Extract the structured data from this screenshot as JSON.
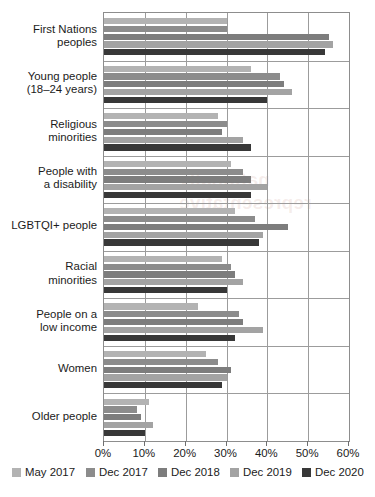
{
  "watermark": {
    "text": "nationally representative"
  },
  "chart_data": {
    "type": "bar",
    "orientation": "horizontal",
    "title": "",
    "subtitle": "",
    "xlabel": "",
    "ylabel": "",
    "xlim": [
      0,
      60
    ],
    "grid": true,
    "legend_position": "bottom",
    "xticks": [
      0,
      10,
      20,
      30,
      40,
      50,
      60
    ],
    "xtick_labels": [
      "0%",
      "10%",
      "20%",
      "30%",
      "40%",
      "50%",
      "60%"
    ],
    "categories": [
      "First Nations peoples",
      "Young people (18–24 years)",
      "Religious minorities",
      "People with a disability",
      "LGBTQI+ people",
      "Racial minorities",
      "People on a low income",
      "Women",
      "Older people"
    ],
    "category_lines": [
      [
        "First Nations",
        "peoples"
      ],
      [
        "Young people",
        "(18–24 years)"
      ],
      [
        "Religious",
        "minorities"
      ],
      [
        "People with",
        "a disability"
      ],
      [
        "LGBTQI+ people"
      ],
      [
        "Racial",
        "minorities"
      ],
      [
        "People on a",
        "low income"
      ],
      [
        "Women"
      ],
      [
        "Older people"
      ]
    ],
    "series": [
      {
        "name": "May 2017",
        "color": "#b3b3b3",
        "values": [
          30,
          36,
          28,
          31,
          32,
          29,
          23,
          25,
          11
        ]
      },
      {
        "name": "Dec 2017",
        "color": "#8c8c8c",
        "values": [
          30,
          43,
          30,
          34,
          37,
          31,
          33,
          28,
          8
        ]
      },
      {
        "name": "Dec 2018",
        "color": "#7d7d7d",
        "values": [
          55,
          44,
          29,
          36,
          45,
          32,
          34,
          31,
          9
        ]
      },
      {
        "name": "Dec 2019",
        "color": "#a3a3a3",
        "values": [
          56,
          46,
          34,
          40,
          39,
          34,
          39,
          30,
          12
        ]
      },
      {
        "name": "Dec 2020",
        "color": "#383838",
        "values": [
          54,
          40,
          36,
          36,
          38,
          30,
          32,
          29,
          10
        ]
      }
    ]
  }
}
